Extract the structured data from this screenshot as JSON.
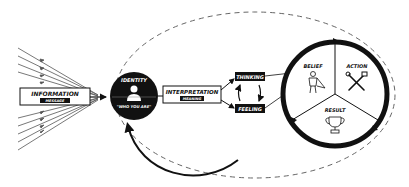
{
  "diagram": {
    "colors": {
      "ink": "#111111",
      "background": "#ffffff",
      "dashed": "#666666",
      "ray": "#555555"
    },
    "nodes": {
      "information": {
        "label": "INFORMATION",
        "sublabel": "MESSAGE"
      },
      "identity": {
        "label": "IDENTITY",
        "sublabel": "\"WHO YOU ARE\"",
        "icon": "person-icon"
      },
      "interpretation": {
        "label": "INTERPRETATION",
        "sublabel": "MEANING"
      },
      "thinking": {
        "label": "THINKING"
      },
      "feeling": {
        "label": "FEELING"
      }
    },
    "cycle": {
      "segments": [
        {
          "label": "BELIEF",
          "icon": "superhero-icon"
        },
        {
          "label": "ACTION",
          "icon": "tools-icon"
        },
        {
          "label": "RESULT",
          "icon": "trophy-icon"
        }
      ]
    },
    "edges": [
      {
        "from": "incoming-rays",
        "to": "information"
      },
      {
        "from": "information",
        "to": "identity"
      },
      {
        "from": "identity",
        "to": "interpretation"
      },
      {
        "from": "interpretation",
        "to": "thinking"
      },
      {
        "from": "interpretation",
        "to": "feeling"
      },
      {
        "from": "thinking",
        "to": "feeling",
        "bidirectional": true
      },
      {
        "from": "thinking",
        "to": "belief"
      },
      {
        "from": "feeling",
        "to": "belief"
      },
      {
        "from": "result",
        "to": "identity",
        "style": "curved-feedback"
      }
    ]
  }
}
